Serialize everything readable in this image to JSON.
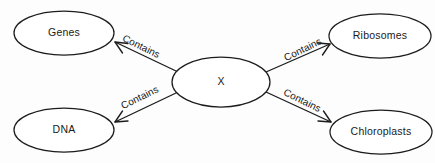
{
  "diagram": {
    "type": "concept-map",
    "background_color": "#fdfdfd",
    "stroke_color": "#1c1c1c",
    "text_color": "#1a1a1a",
    "nodes": [
      {
        "id": "genes",
        "label": "Genes",
        "cx": 64,
        "cy": 33,
        "rx": 50,
        "ry": 22
      },
      {
        "id": "ribosomes",
        "label": "Ribosomes",
        "cx": 380,
        "cy": 36,
        "rx": 51,
        "ry": 22
      },
      {
        "id": "center",
        "label": "X",
        "cx": 221,
        "cy": 82,
        "rx": 49,
        "ry": 25
      },
      {
        "id": "dna",
        "label": "DNA",
        "cx": 64,
        "cy": 130,
        "rx": 50,
        "ry": 22
      },
      {
        "id": "chloroplasts",
        "label": "Chloroplasts",
        "cx": 381,
        "cy": 132,
        "rx": 51,
        "ry": 22
      }
    ],
    "edges": [
      {
        "id": "center-to-genes",
        "label": "Contains",
        "from": "center",
        "to": "genes",
        "label_x": 141,
        "label_y": 47,
        "label_angle": 26
      },
      {
        "id": "center-to-ribosomes",
        "label": "Contains",
        "from": "center",
        "to": "ribosomes",
        "label_x": 303,
        "label_y": 50,
        "label_angle": -26
      },
      {
        "id": "center-to-dna",
        "label": "Contains",
        "from": "center",
        "to": "dna",
        "label_x": 140,
        "label_y": 98,
        "label_angle": -26
      },
      {
        "id": "center-to-chloroplasts",
        "label": "Contains",
        "from": "center",
        "to": "chloroplasts",
        "label_x": 302,
        "label_y": 101,
        "label_angle": 26
      }
    ]
  }
}
